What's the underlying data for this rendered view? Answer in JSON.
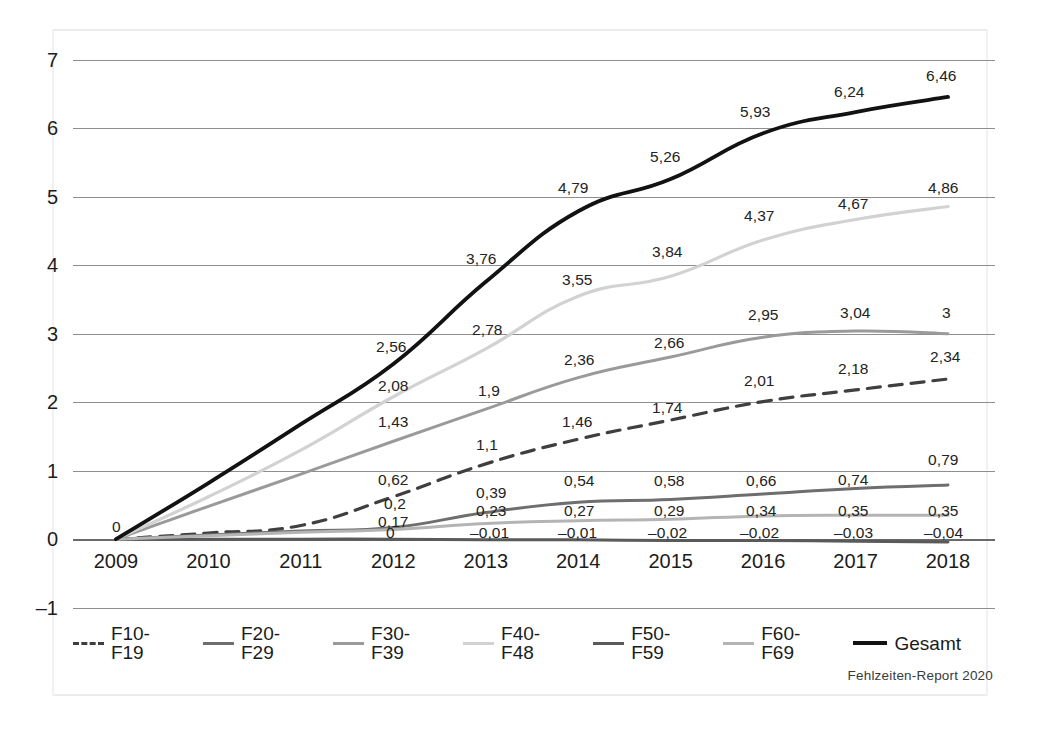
{
  "source_note": "Fehlzeiten-Report 2020",
  "axis": {
    "y_ticks": [
      "7",
      "6",
      "5",
      "4",
      "3",
      "2",
      "1",
      "0",
      "–1"
    ],
    "x_ticks": [
      "2009",
      "2010",
      "2011",
      "2012",
      "2013",
      "2014",
      "2015",
      "2016",
      "2017",
      "2018"
    ]
  },
  "legend": {
    "items": [
      {
        "label": "F10-F19",
        "color": "#3f3f3f",
        "style": "dashed"
      },
      {
        "label": "F20-F29",
        "color": "#6e6e6e",
        "style": "solid"
      },
      {
        "label": "F30-F39",
        "color": "#9a9a9a",
        "style": "solid"
      },
      {
        "label": "F40-F48",
        "color": "#d2d2d2",
        "style": "solid"
      },
      {
        "label": "F50-F59",
        "color": "#5a5a5a",
        "style": "solid"
      },
      {
        "label": "F60-F69",
        "color": "#b4b4b4",
        "style": "solid"
      },
      {
        "label": "Gesamt",
        "color": "#121212",
        "style": "solid"
      }
    ]
  },
  "chart_data": {
    "type": "line",
    "title": "",
    "xlabel": "",
    "ylabel": "",
    "ylim": [
      -1,
      7
    ],
    "grid": true,
    "legend_position": "bottom",
    "decimal_separator": ",",
    "x": [
      "2009",
      "2010",
      "2011",
      "2012",
      "2013",
      "2014",
      "2015",
      "2016",
      "2017",
      "2018"
    ],
    "series": [
      {
        "name": "F10-F19",
        "color": "#3f3f3f",
        "style": "dashed",
        "width": 3.2,
        "values": [
          0,
          0.09,
          0.2,
          0.62,
          1.1,
          1.46,
          1.74,
          2.01,
          2.18,
          2.34
        ],
        "labels": [
          {
            "x": "2011",
            "text": "0,2",
            "lx": 384,
            "ly": 496
          },
          {
            "x": "2012",
            "text": "0,62",
            "lx": 378,
            "ly": 472
          },
          {
            "x": "2013",
            "text": "1,1",
            "lx": 476,
            "ly": 437
          },
          {
            "x": "2014",
            "text": "1,46",
            "lx": 562,
            "ly": 414
          },
          {
            "x": "2015",
            "text": "1,74",
            "lx": 652,
            "ly": 400
          },
          {
            "x": "2016",
            "text": "2,01",
            "lx": 744,
            "ly": 373
          },
          {
            "x": "2017",
            "text": "2,18",
            "lx": 838,
            "ly": 361
          },
          {
            "x": "2018",
            "text": "2,34",
            "lx": 930,
            "ly": 349
          }
        ]
      },
      {
        "name": "F20-F29",
        "color": "#6e6e6e",
        "style": "solid",
        "width": 3.0,
        "values": [
          0,
          0.06,
          0.12,
          0.17,
          0.39,
          0.54,
          0.58,
          0.66,
          0.74,
          0.79
        ],
        "labels": [
          {
            "x": "2011",
            "text": "0,17",
            "lx": 378,
            "ly": 514
          },
          {
            "x": "2013",
            "text": "0,39",
            "lx": 476,
            "ly": 485
          },
          {
            "x": "2014",
            "text": "0,54",
            "lx": 564,
            "ly": 473
          },
          {
            "x": "2015",
            "text": "0,58",
            "lx": 654,
            "ly": 473
          },
          {
            "x": "2016",
            "text": "0,66",
            "lx": 746,
            "ly": 473
          },
          {
            "x": "2017",
            "text": "0,74",
            "lx": 838,
            "ly": 472
          },
          {
            "x": "2018",
            "text": "0,79",
            "lx": 928,
            "ly": 452
          }
        ]
      },
      {
        "name": "F30-F39",
        "color": "#9a9a9a",
        "style": "solid",
        "width": 3.0,
        "values": [
          0,
          0.48,
          0.95,
          1.43,
          1.9,
          2.36,
          2.66,
          2.95,
          3.04,
          3.0
        ],
        "labels": [
          {
            "x": "2012",
            "text": "1,43",
            "lx": 378,
            "ly": 414
          },
          {
            "x": "2013",
            "text": "1,9",
            "lx": 478,
            "ly": 383
          },
          {
            "x": "2014",
            "text": "2,36",
            "lx": 564,
            "ly": 352
          },
          {
            "x": "2015",
            "text": "2,66",
            "lx": 654,
            "ly": 335
          },
          {
            "x": "2016",
            "text": "2,95",
            "lx": 748,
            "ly": 307
          },
          {
            "x": "2017",
            "text": "3,04",
            "lx": 840,
            "ly": 305
          },
          {
            "x": "2018",
            "text": "3",
            "lx": 942,
            "ly": 305
          }
        ]
      },
      {
        "name": "F40-F48",
        "color": "#d2d2d2",
        "style": "solid",
        "width": 3.2,
        "values": [
          0,
          0.62,
          1.3,
          2.08,
          2.78,
          3.55,
          3.84,
          4.37,
          4.67,
          4.86
        ],
        "labels": [
          {
            "x": "2012",
            "text": "2,08",
            "lx": 378,
            "ly": 378
          },
          {
            "x": "2013",
            "text": "2,78",
            "lx": 472,
            "ly": 322
          },
          {
            "x": "2014",
            "text": "3,55",
            "lx": 562,
            "ly": 272
          },
          {
            "x": "2015",
            "text": "3,84",
            "lx": 652,
            "ly": 244
          },
          {
            "x": "2016",
            "text": "4,37",
            "lx": 744,
            "ly": 208
          },
          {
            "x": "2017",
            "text": "4,67",
            "lx": 838,
            "ly": 196
          },
          {
            "x": "2018",
            "text": "4,86",
            "lx": 928,
            "ly": 180
          }
        ]
      },
      {
        "name": "F50-F59",
        "color": "#5a5a5a",
        "style": "solid",
        "width": 3.0,
        "values": [
          0,
          0,
          0,
          0,
          -0.01,
          -0.01,
          -0.02,
          -0.02,
          -0.03,
          -0.04
        ],
        "labels": [
          {
            "x": "2012",
            "text": "0",
            "lx": 386,
            "ly": 525
          },
          {
            "x": "2013",
            "text": "–0,01",
            "lx": 470,
            "ly": 525
          },
          {
            "x": "2014",
            "text": "–0,01",
            "lx": 558,
            "ly": 525
          },
          {
            "x": "2015",
            "text": "–0,02",
            "lx": 648,
            "ly": 525
          },
          {
            "x": "2016",
            "text": "–0,02",
            "lx": 740,
            "ly": 525
          },
          {
            "x": "2017",
            "text": "–0,03",
            "lx": 834,
            "ly": 525
          },
          {
            "x": "2018",
            "text": "–0,04",
            "lx": 924,
            "ly": 525
          }
        ]
      },
      {
        "name": "F60-F69",
        "color": "#b4b4b4",
        "style": "solid",
        "width": 3.0,
        "values": [
          0,
          0.05,
          0.1,
          0.14,
          0.23,
          0.27,
          0.29,
          0.34,
          0.35,
          0.35
        ],
        "labels": [
          {
            "x": "2013",
            "text": "0,23",
            "lx": 476,
            "ly": 503
          },
          {
            "x": "2014",
            "text": "0,27",
            "lx": 564,
            "ly": 503
          },
          {
            "x": "2015",
            "text": "0,29",
            "lx": 654,
            "ly": 503
          },
          {
            "x": "2016",
            "text": "0,34",
            "lx": 746,
            "ly": 503
          },
          {
            "x": "2017",
            "text": "0,35",
            "lx": 838,
            "ly": 503
          },
          {
            "x": "2018",
            "text": "0,35",
            "lx": 928,
            "ly": 503
          }
        ]
      },
      {
        "name": "Gesamt",
        "color": "#121212",
        "style": "solid",
        "width": 3.8,
        "values": [
          0,
          0.82,
          1.68,
          2.56,
          3.76,
          4.79,
          5.26,
          5.93,
          6.24,
          6.46
        ],
        "labels": [
          {
            "x": "2009",
            "text": "0",
            "lx": 112,
            "ly": 519
          },
          {
            "x": "2012",
            "text": "2,56",
            "lx": 376,
            "ly": 339
          },
          {
            "x": "2013",
            "text": "3,76",
            "lx": 466,
            "ly": 251
          },
          {
            "x": "2014",
            "text": "4,79",
            "lx": 558,
            "ly": 180
          },
          {
            "x": "2015",
            "text": "5,26",
            "lx": 650,
            "ly": 149
          },
          {
            "x": "2016",
            "text": "5,93",
            "lx": 740,
            "ly": 104
          },
          {
            "x": "2017",
            "text": "6,24",
            "lx": 834,
            "ly": 84
          },
          {
            "x": "2018",
            "text": "6,46",
            "lx": 926,
            "ly": 68
          }
        ]
      }
    ]
  }
}
